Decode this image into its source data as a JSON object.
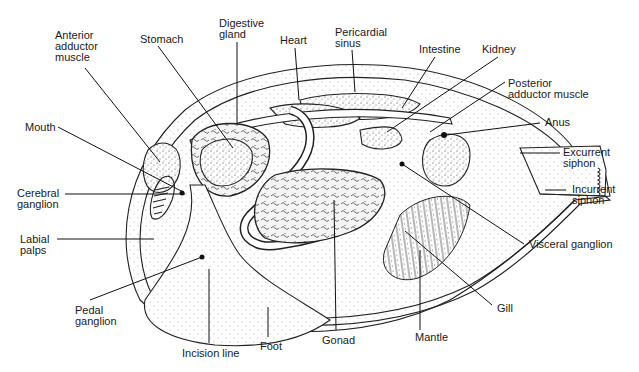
{
  "diagram": {
    "labels": {
      "anterior_adductor_muscle": "Anterior\nadductor\nmuscle",
      "stomach": "Stomach",
      "digestive_gland": "Digestive\ngland",
      "heart": "Heart",
      "pericardial_sinus": "Pericardial\nsinus",
      "intestine": "Intestine",
      "kidney": "Kidney",
      "posterior_adductor_muscle": "Posterior\nadductor muscle",
      "anus": "Anus",
      "excurrent_siphon": "Excurrent\nsiphon",
      "incurrent_siphon": "Incurrent\nsiphon",
      "mouth": "Mouth",
      "cerebral_ganglion": "Cerebral\nganglion",
      "labial_palps": "Labial\npalps",
      "pedal_ganglion": "Pedal\nganglion",
      "incision_line": "Incision line",
      "foot": "Foot",
      "gonad": "Gonad",
      "mantle": "Mantle",
      "gill": "Gill",
      "visceral_ganglion": "Visceral ganglion"
    }
  }
}
